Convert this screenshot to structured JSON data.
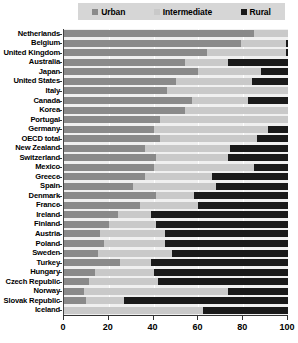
{
  "chart_data": {
    "type": "bar",
    "orientation": "horizontal",
    "stacked": true,
    "stacked_percent": true,
    "title": "",
    "subtitle": "",
    "xlabel": "",
    "ylabel": "",
    "xlim": [
      0,
      100
    ],
    "xticks": [
      0,
      20,
      40,
      60,
      80,
      100
    ],
    "xticklabels": [
      "0",
      "20",
      "40",
      "60",
      "80",
      "100"
    ],
    "grid": true,
    "grid_axis": "x",
    "legend_position": "top",
    "legend": [
      "Urban",
      "Intermediate",
      "Rural"
    ],
    "colors": {
      "Urban": "#8a8a8a",
      "Intermediate": "#c9c9c9",
      "Rural": "#1a1a1a",
      "plot_background": "#f0f0f0",
      "legend_background": "#d6d6d6",
      "axis": "#333333",
      "gridline": "#ffffff",
      "text": "#000000"
    },
    "categories": [
      "Netherlands",
      "Belgium",
      "United Kingdom",
      "Australia",
      "Japan",
      "United States",
      "Italy",
      "Canada",
      "Korea",
      "Portugal",
      "Germany",
      "OECD total",
      "New Zealand",
      "Switzerland",
      "Mexico",
      "Greece",
      "Spain",
      "Denmark",
      "France",
      "Ireland",
      "Finland",
      "Austria",
      "Poland",
      "Sweden",
      "Turkey",
      "Hungary",
      "Czech Republic",
      "Norway",
      "Slovak Republic",
      "Iceland"
    ],
    "series": [
      {
        "name": "Urban",
        "values": [
          85,
          79,
          64,
          54,
          60,
          50,
          46,
          57,
          54,
          43,
          40,
          43,
          36,
          41,
          40,
          36,
          31,
          41,
          34,
          24,
          20,
          16,
          18,
          15,
          25,
          14,
          11,
          9,
          10,
          0
        ]
      },
      {
        "name": "Intermediate",
        "values": [
          15,
          20,
          35,
          19,
          28,
          34,
          54,
          25,
          46,
          57,
          51,
          43,
          38,
          32,
          45,
          30,
          37,
          17,
          26,
          15,
          21,
          29,
          27,
          33,
          14,
          26,
          31,
          64,
          17,
          62
        ]
      },
      {
        "name": "Rural",
        "values": [
          0,
          1,
          1,
          27,
          12,
          16,
          0,
          18,
          0,
          0,
          9,
          14,
          26,
          27,
          15,
          34,
          32,
          42,
          40,
          61,
          59,
          55,
          55,
          52,
          61,
          60,
          58,
          27,
          73,
          38
        ]
      }
    ]
  }
}
